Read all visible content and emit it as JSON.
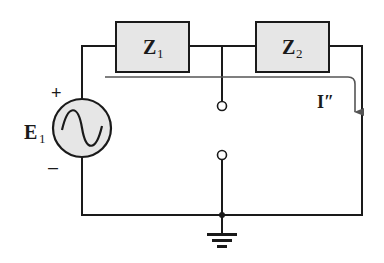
{
  "diagram": {
    "type": "circuit-schematic",
    "colors": {
      "wire": "#1a1a1a",
      "component_fill": "#e6e6e6",
      "current_arrow": "#555555",
      "background": "#ffffff"
    },
    "source": {
      "label": "E",
      "subscript": "1",
      "type": "ac-voltage-source",
      "polarity_plus": "+",
      "polarity_minus": "–"
    },
    "impedances": [
      {
        "label": "Z",
        "subscript": "1"
      },
      {
        "label": "Z",
        "subscript": "2"
      }
    ],
    "current": {
      "label": "I″",
      "direction": "clockwise through Z1 and Z2, downward on right branch"
    },
    "terminals": [
      "open terminal (upper)",
      "open terminal (lower)"
    ],
    "ground": "ground symbol"
  }
}
